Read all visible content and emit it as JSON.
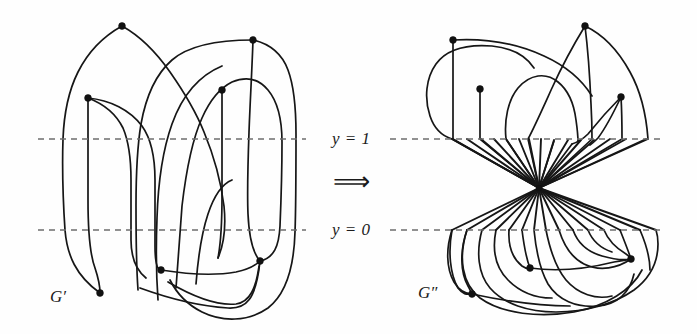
{
  "figure": {
    "width": 697,
    "height": 334,
    "background": "#fefefe",
    "ink_color": "#161616",
    "dash_color": "#6d6d6d",
    "vertex_color": "#111111"
  },
  "labels": {
    "left_graph": {
      "base": "G",
      "prime": "′",
      "full": "G′"
    },
    "right_graph": {
      "base": "G",
      "prime": "″",
      "full": "G″"
    },
    "y_top": {
      "var": "y",
      "op": "=",
      "value": "1",
      "full": "y = 1"
    },
    "y_bottom": {
      "var": "y",
      "op": "=",
      "value": "0",
      "full": "y = 0"
    },
    "implication_arrow": "⟹"
  },
  "axes": {
    "y1": {
      "label": "y = 1",
      "pixel_y": 139,
      "x_start": 38,
      "x_end": 662,
      "style": "dashed"
    },
    "y0": {
      "label": "y = 0",
      "pixel_y": 230,
      "x_start": 38,
      "x_end": 662,
      "style": "dashed"
    }
  },
  "graph_left": {
    "name": "G′",
    "label_position": {
      "x": 50,
      "y": 296
    },
    "vertex_count": 7,
    "vertices": [
      {
        "id": "a",
        "x": 122,
        "y": 26,
        "region": "above-y1"
      },
      {
        "id": "b",
        "x": 253,
        "y": 40,
        "region": "above-y1"
      },
      {
        "id": "c",
        "x": 88,
        "y": 98,
        "region": "above-y1"
      },
      {
        "id": "d",
        "x": 222,
        "y": 90,
        "region": "above-y1"
      },
      {
        "id": "e",
        "x": 100,
        "y": 293,
        "region": "below-y0"
      },
      {
        "id": "f",
        "x": 161,
        "y": 270,
        "region": "below-y0"
      },
      {
        "id": "g",
        "x": 260,
        "y": 261,
        "region": "below-y0"
      }
    ]
  },
  "graph_right": {
    "name": "G″",
    "label_position": {
      "x": 418,
      "y": 292
    },
    "hub": {
      "x": 539,
      "y": 188,
      "spoke_count": 22
    },
    "vertex_count": 8,
    "vertices": [
      {
        "id": "a",
        "x": 453,
        "y": 40,
        "region": "above-y1"
      },
      {
        "id": "b",
        "x": 585,
        "y": 26,
        "region": "above-y1"
      },
      {
        "id": "c",
        "x": 480,
        "y": 89,
        "region": "above-y1"
      },
      {
        "id": "d",
        "x": 621,
        "y": 97,
        "region": "above-y1"
      },
      {
        "id": "e",
        "x": 472,
        "y": 294,
        "region": "below-y0"
      },
      {
        "id": "f",
        "x": 530,
        "y": 268,
        "region": "below-y0"
      },
      {
        "id": "g",
        "x": 631,
        "y": 259,
        "region": "below-y0"
      }
    ]
  }
}
